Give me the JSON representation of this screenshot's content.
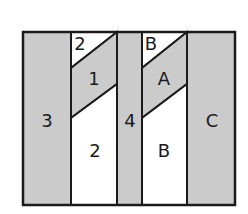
{
  "diagram": {
    "colors": {
      "shaded": "#cbcbcb",
      "unshaded": "#ffffff",
      "stroke": "#1a1a1a"
    },
    "pieces": [
      {
        "id": "piece-3",
        "label": "3",
        "shaded": true
      },
      {
        "id": "piece-2-top",
        "label": "2",
        "shaded": false
      },
      {
        "id": "piece-1",
        "label": "1",
        "shaded": true
      },
      {
        "id": "piece-2-bottom",
        "label": "2",
        "shaded": false
      },
      {
        "id": "piece-4",
        "label": "4",
        "shaded": true
      },
      {
        "id": "piece-b-top",
        "label": "B",
        "shaded": false
      },
      {
        "id": "piece-a",
        "label": "A",
        "shaded": true
      },
      {
        "id": "piece-b-bottom",
        "label": "B",
        "shaded": false
      },
      {
        "id": "piece-c",
        "label": "C",
        "shaded": true
      }
    ]
  }
}
